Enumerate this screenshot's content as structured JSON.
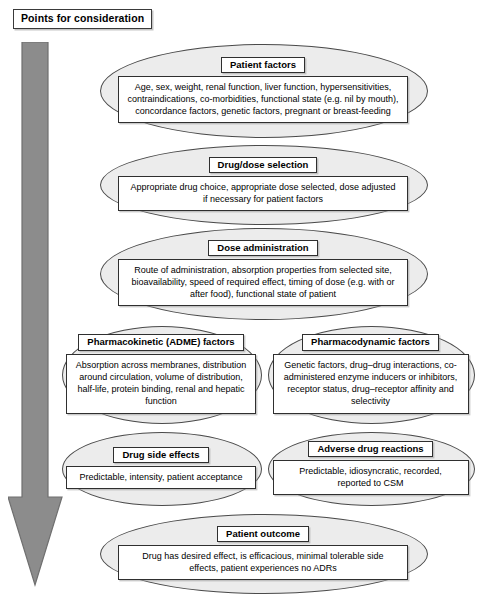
{
  "title": {
    "label": "Points for consideration"
  },
  "flow_arrow": {
    "name": "downward-flow-arrow",
    "direction": "down",
    "color": "#8c8c8c"
  },
  "nodes": [
    {
      "id": "patient-factors",
      "header": "Patient factors",
      "body": "Age, sex, weight, renal function, liver function, hypersensitivities, contraindications, co-morbidities, functional state (e.g. nil by mouth), concordance factors, genetic factors, pregnant or breast-feeding",
      "layout": "wide"
    },
    {
      "id": "drug-dose-selection",
      "header": "Drug/dose selection",
      "body": "Appropriate drug choice, appropriate dose selected, dose adjusted if necessary for patient factors",
      "layout": "wide"
    },
    {
      "id": "dose-administration",
      "header": "Dose administration",
      "body": "Route of administration, absorption properties from selected site, bioavailability, speed of required effect, timing of dose (e.g. with or after food), functional state of patient",
      "layout": "wide"
    },
    {
      "id": "pharmacokinetic-adme-factors",
      "header": "Pharmacokinetic (ADME) factors",
      "body": "Absorption across membranes, distribution around circulation, volume of distribution, half-life, protein binding, renal and hepatic function",
      "layout": "half-left"
    },
    {
      "id": "pharmacodynamic-factors",
      "header": "Pharmacodynamic factors",
      "body": "Genetic factors, drug–drug interactions, co-administered enzyme inducers or inhibitors, receptor status, drug–receptor affinity and selectivity",
      "layout": "half-right"
    },
    {
      "id": "drug-side-effects",
      "header": "Drug side effects",
      "body": "Predictable, intensity, patient acceptance",
      "layout": "half-left"
    },
    {
      "id": "adverse-drug-reactions",
      "header": "Adverse drug reactions",
      "body": "Predictable, idiosyncratic, recorded, reported to CSM",
      "layout": "half-right"
    },
    {
      "id": "patient-outcome",
      "header": "Patient outcome",
      "body": "Drug has desired effect, is efficacious, minimal tolerable side effects, patient experiences no ADRs",
      "layout": "wide"
    }
  ],
  "caption": {
    "text": ""
  },
  "colors": {
    "ellipse_fill": "#ececec",
    "ellipse_stroke": "#4a4a4a",
    "box_fill": "#ffffff",
    "box_stroke": "#2f2f2f",
    "arrow_fill": "#8c8c8c",
    "background": "#ffffff"
  }
}
